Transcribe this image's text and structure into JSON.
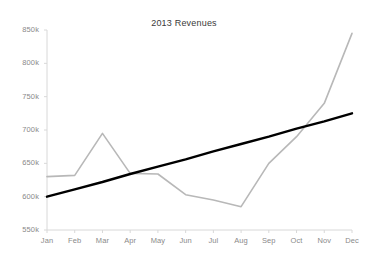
{
  "chart_data": {
    "type": "line",
    "title": "2013 Revenues",
    "xlabel": "",
    "ylabel": "",
    "categories": [
      "Jan",
      "Feb",
      "Mar",
      "Apr",
      "May",
      "Jun",
      "Jul",
      "Aug",
      "Sep",
      "Oct",
      "Nov",
      "Dec"
    ],
    "series": [
      {
        "name": "Revenue",
        "color": "#b8b8b8",
        "values": [
          630,
          632,
          695,
          635,
          634,
          603,
          595,
          585,
          650,
          690,
          740,
          845
        ]
      },
      {
        "name": "Trendline",
        "color": "#000000",
        "values": [
          600,
          611,
          622,
          634,
          645,
          656,
          668,
          679,
          690,
          702,
          713,
          725
        ]
      }
    ],
    "ylim": [
      550,
      850
    ],
    "yticks": [
      550,
      600,
      650,
      700,
      750,
      800,
      850
    ],
    "ytick_labels": [
      "550k",
      "600k",
      "650k",
      "700k",
      "750k",
      "800k",
      "850k"
    ],
    "grid": false,
    "legend": "none",
    "axis_color": "#d8d8d8",
    "units": "thousands"
  }
}
